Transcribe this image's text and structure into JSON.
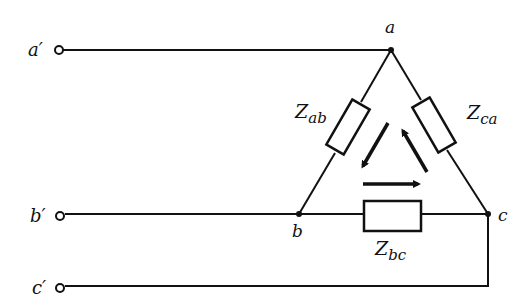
{
  "diagram": {
    "type": "delta-connected three-phase load",
    "terminals": [
      {
        "id": "a_prime",
        "label": "a′"
      },
      {
        "id": "b_prime",
        "label": "b′"
      },
      {
        "id": "c_prime",
        "label": "c′"
      }
    ],
    "nodes": [
      {
        "id": "a",
        "label": "a"
      },
      {
        "id": "b",
        "label": "b"
      },
      {
        "id": "c",
        "label": "c"
      }
    ],
    "impedances": [
      {
        "id": "Zab",
        "symbol": "Z",
        "subscript": "ab"
      },
      {
        "id": "Zbc",
        "symbol": "Z",
        "subscript": "bc"
      },
      {
        "id": "Zca",
        "symbol": "Z",
        "subscript": "ca"
      }
    ],
    "current_arrows": [
      "a→b",
      "b→c",
      "c→a"
    ],
    "colors": {
      "line": "#111111",
      "background": "#ffffff"
    }
  }
}
